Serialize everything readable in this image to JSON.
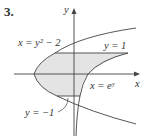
{
  "problem_number": "3.",
  "axes": {
    "x_label": "x",
    "y_label": "y"
  },
  "curves": [
    {
      "id": "parabola",
      "label": "x = y² − 2"
    },
    {
      "id": "exp",
      "label": "x = eʸ"
    }
  ],
  "lines": [
    {
      "id": "upper",
      "label": "y = 1"
    },
    {
      "id": "lower",
      "label": "y = −1"
    }
  ],
  "colors": {
    "shade": "#e4e4e4",
    "stroke": "#444444"
  }
}
